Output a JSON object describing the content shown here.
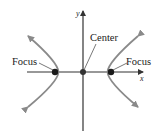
{
  "diagram": {
    "type": "hyperbola",
    "axes": {
      "x_label": "x",
      "y_label": "y"
    },
    "labels": {
      "left_focus": "Focus",
      "center": "Center",
      "right_focus": "Focus"
    },
    "colors": {
      "axis": "#333333",
      "curve": "#8a8a8a",
      "point": "#1a1a1a",
      "text": "#1a1a1a"
    }
  }
}
